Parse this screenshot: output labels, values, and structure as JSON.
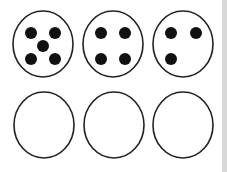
{
  "worksheet": {
    "title": "Dot counting circles",
    "top_row": [
      {
        "label": "circle-five-dots",
        "dot_count": 5,
        "pattern": "dice-five"
      },
      {
        "label": "circle-four-dots",
        "dot_count": 4,
        "pattern": "dice-four"
      },
      {
        "label": "circle-three-dots",
        "dot_count": 3,
        "pattern": "partial-square"
      }
    ],
    "bottom_row": [
      {
        "label": "empty-circle-1",
        "dot_count": 0
      },
      {
        "label": "empty-circle-2",
        "dot_count": 0
      },
      {
        "label": "empty-circle-3",
        "dot_count": 0
      }
    ],
    "colors": {
      "stroke": "#222222",
      "dot": "#111111",
      "background": "#ffffff",
      "edge": "#d8d8d8"
    }
  }
}
